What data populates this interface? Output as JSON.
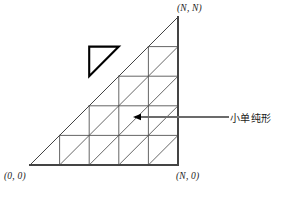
{
  "figure": {
    "title": "",
    "labels": {
      "top_right": "(N, N)",
      "bottom_left": "(0, 0)",
      "bottom_right": "(N, 0)",
      "annotation": "小单纯形"
    },
    "colors": {
      "grid_line": "#555555",
      "outline": "#444444",
      "highlight": "#000000",
      "leader": "#6b6b6b",
      "text": "#1a1a1a",
      "background": "#ffffff"
    }
  },
  "chart_data": {
    "type": "diagram",
    "subtype": "triangular-lattice",
    "title": "小单纯形",
    "grid": {
      "n_divisions": 5,
      "origin": [
        0,
        0
      ],
      "x_max": "N",
      "y_max": "N",
      "x0_px": 30,
      "y0_px": 165,
      "cell_px": 29.6,
      "rows": 5,
      "cols": 5
    },
    "vertices": {
      "bottom_left": [
        0,
        0
      ],
      "bottom_right": [
        "N",
        0
      ],
      "top_right": [
        "N",
        "N"
      ]
    },
    "corner_labels": [
      {
        "name": "top-right",
        "text": "(N, N)",
        "x": "N",
        "y": "N"
      },
      {
        "name": "bottom-left",
        "text": "(0, 0)",
        "x": 0,
        "y": 0
      },
      {
        "name": "bottom-right",
        "text": "(N, 0)",
        "x": "N",
        "y": 0
      }
    ],
    "highlighted_cell": {
      "label": "小单纯形",
      "col": 3,
      "row": 4,
      "half": "upper-left",
      "stroke_width": 2.1
    },
    "annotation": {
      "text": "小单纯形",
      "leader_from": [
        228,
        117
      ],
      "leader_to": [
        133,
        117
      ],
      "arrow": true
    },
    "grid_on": true,
    "legend": "none"
  }
}
